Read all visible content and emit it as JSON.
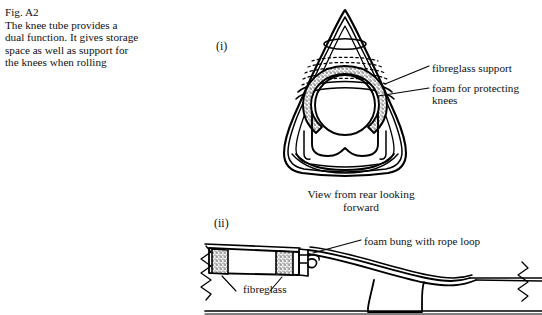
{
  "figure": {
    "number": "Fig. A2",
    "caption_lines": [
      "Fig. A2",
      "The knee tube provides a",
      "dual function. It gives storage",
      "space as well as support for",
      "the knees when rolling"
    ]
  },
  "views": {
    "upper": {
      "marker": "(i)",
      "sub_caption_line1": "View from rear looking",
      "sub_caption_line2": "forward",
      "labels": {
        "fibreglass_support": "fibreglass support",
        "foam_for_knees": "foam for protecting knees"
      }
    },
    "lower": {
      "marker": "(ii)",
      "labels": {
        "foam_bung": "foam bung with rope loop",
        "fibreglass": "fibreglass"
      }
    }
  },
  "style": {
    "ink_color": "#000000",
    "background": "#ffffff"
  }
}
